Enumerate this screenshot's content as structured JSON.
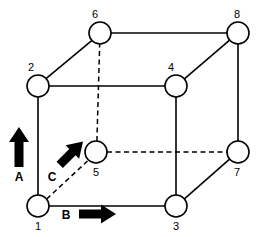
{
  "figure": {
    "background_color": "#ffffff",
    "line_color": "#000000",
    "width": 262,
    "height": 237
  },
  "nodes": [
    {
      "id": "1",
      "label": "1",
      "cx": 38,
      "cy": 206,
      "r": 11,
      "label_x": 38,
      "label_y": 229,
      "hidden": false
    },
    {
      "id": "2",
      "label": "2",
      "cx": 38,
      "cy": 86,
      "r": 11,
      "label_x": 34,
      "label_y": 70,
      "hidden": false
    },
    {
      "id": "3",
      "label": "3",
      "cx": 176,
      "cy": 206,
      "r": 11,
      "label_x": 176,
      "label_y": 229,
      "hidden": false
    },
    {
      "id": "4",
      "label": "4",
      "cx": 176,
      "cy": 86,
      "r": 11,
      "label_x": 172,
      "label_y": 70,
      "hidden": false
    },
    {
      "id": "5",
      "label": "5",
      "cx": 96,
      "cy": 152,
      "r": 11,
      "label_x": 96,
      "label_y": 176,
      "hidden": true
    },
    {
      "id": "6",
      "label": "6",
      "cx": 100,
      "cy": 33,
      "r": 11,
      "label_x": 96,
      "label_y": 17,
      "hidden": false
    },
    {
      "id": "7",
      "label": "7",
      "cx": 238,
      "cy": 152,
      "r": 11,
      "label_x": 236,
      "label_y": 176,
      "hidden": false
    },
    {
      "id": "8",
      "label": "8",
      "cx": 238,
      "cy": 33,
      "r": 11,
      "label_x": 236,
      "label_y": 17,
      "hidden": false
    }
  ],
  "edges": [
    {
      "name": "edge-1-2",
      "from": "1",
      "to": "2",
      "style": "solid"
    },
    {
      "name": "edge-1-3",
      "from": "1",
      "to": "3",
      "style": "solid"
    },
    {
      "name": "edge-2-4",
      "from": "2",
      "to": "4",
      "style": "solid"
    },
    {
      "name": "edge-2-6",
      "from": "2",
      "to": "6",
      "style": "solid"
    },
    {
      "name": "edge-3-4",
      "from": "3",
      "to": "4",
      "style": "solid"
    },
    {
      "name": "edge-3-7",
      "from": "3",
      "to": "7",
      "style": "solid"
    },
    {
      "name": "edge-4-8",
      "from": "4",
      "to": "8",
      "style": "solid"
    },
    {
      "name": "edge-6-8",
      "from": "6",
      "to": "8",
      "style": "solid"
    },
    {
      "name": "edge-7-8",
      "from": "7",
      "to": "8",
      "style": "solid"
    },
    {
      "name": "edge-1-5",
      "from": "1",
      "to": "5",
      "style": "dashed"
    },
    {
      "name": "edge-5-6",
      "from": "5",
      "to": "6",
      "style": "dashed"
    },
    {
      "name": "edge-5-7",
      "from": "5",
      "to": "7",
      "style": "dashed"
    }
  ],
  "arrows": [
    {
      "name": "arrow-a",
      "label": "A",
      "direction": "up",
      "label_x": 19,
      "label_y": 180,
      "tail_x": 19,
      "tail_y": 167,
      "head_x": 19,
      "head_y": 129
    },
    {
      "name": "arrow-b",
      "label": "B",
      "direction": "right",
      "label_x": 66,
      "label_y": 219,
      "tail_x": 80,
      "tail_y": 214,
      "head_x": 114,
      "head_y": 214
    },
    {
      "name": "arrow-c",
      "label": "C",
      "direction": "up-right",
      "label_x": 52,
      "label_y": 180,
      "tail_x": 58,
      "tail_y": 167,
      "head_x": 85,
      "head_y": 140
    }
  ]
}
